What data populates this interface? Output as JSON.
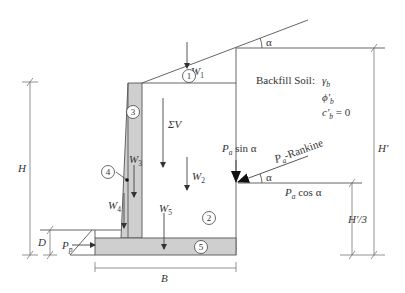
{
  "diagram": {
    "backfill": {
      "label": "Backfill Soil:",
      "gamma": "γ",
      "gamma_sub": "b",
      "phi": "ϕ′",
      "phi_sub": "b",
      "c": "c′",
      "c_sub": "b",
      "c_value": " = 0"
    },
    "angle_label": "α",
    "zones": [
      "1",
      "2",
      "3",
      "4",
      "5"
    ],
    "weights": {
      "w1": "W",
      "w1_sub": "1",
      "w2": "W",
      "w2_sub": "2",
      "w3": "W",
      "w3_sub": "3",
      "w4": "W",
      "w4_sub": "4",
      "w5": "W",
      "w5_sub": "5",
      "sum_v": "ΣV"
    },
    "forces": {
      "pa_sin": "P",
      "pa_sin_sub": "a",
      "pa_sin_rest": " sin α",
      "pa_cos": "P",
      "pa_cos_sub": "a",
      "pa_cos_rest": " cos α",
      "pa_rankine": "P",
      "pa_rankine_sub": "a",
      "pa_rankine_rest": "-Rankine",
      "pp": "P",
      "pp_sub": "p"
    },
    "dimensions": {
      "H": "H",
      "H_prime": "H′",
      "H_prime_third": "H′/3",
      "D": "D",
      "B": "B"
    }
  }
}
